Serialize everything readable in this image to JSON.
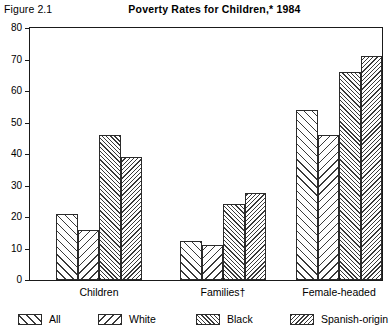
{
  "figure": {
    "number": "Figure 2.1",
    "title": "Poverty Rates for Children,* 1984"
  },
  "chart_data": {
    "type": "bar",
    "title": "Poverty Rates for Children,* 1984",
    "xlabel": "",
    "ylabel": "",
    "ylim": [
      0,
      80
    ],
    "yticks": [
      0,
      10,
      20,
      30,
      40,
      50,
      60,
      70,
      80
    ],
    "ytick_labels": [
      "0",
      "10",
      "20",
      "30",
      "40",
      "50",
      "60",
      "70",
      "80"
    ],
    "grid": false,
    "legend_position": "bottom",
    "categories": [
      "Children",
      "Families†",
      "Female-headed"
    ],
    "series": [
      {
        "name": "All",
        "values": [
          21,
          12.5,
          54
        ]
      },
      {
        "name": "White",
        "values": [
          16,
          11,
          46
        ]
      },
      {
        "name": "Black",
        "values": [
          46,
          24,
          66
        ]
      },
      {
        "name": "Spanish-origin",
        "values": [
          39,
          27.5,
          71
        ]
      }
    ],
    "legend": [
      "All",
      "White",
      "Black",
      "Spanish-origin"
    ],
    "annotations": []
  },
  "legend_patterns": {
    "all": "forward-hatch-sparse",
    "white": "backward-hatch-sparse",
    "black": "forward-hatch-dense",
    "spanish": "backward-hatch-dense"
  }
}
